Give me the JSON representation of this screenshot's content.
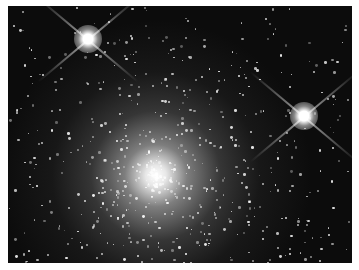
{
  "image": {
    "description": "Globular star cluster with two bright foreground stars showing diffraction spikes",
    "background_color": "#0c0c0c",
    "border_color": "#ffffff",
    "cluster_core": {
      "x_pct": 43,
      "y_pct": 66
    },
    "bright_stars": [
      {
        "name": "upper-left-star",
        "x": 80,
        "y": 33
      },
      {
        "name": "right-star",
        "x": 296,
        "y": 110
      }
    ]
  }
}
